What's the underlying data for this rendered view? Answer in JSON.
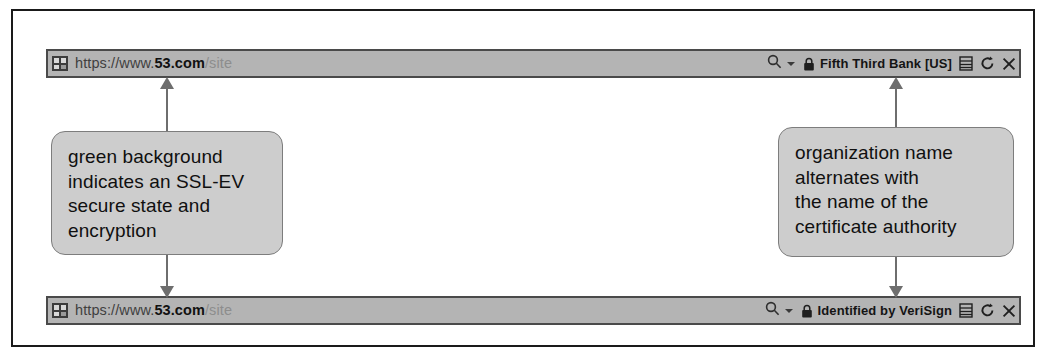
{
  "address_bars": [
    {
      "id": "top",
      "favicon": "site-favicon-icon",
      "url": {
        "full": "https://www.53.com/site",
        "scheme": "https://www.",
        "domain": "53.com",
        "path": "/site"
      },
      "search_icon": "search-icon",
      "dropdown_icon": "chevron-down-icon",
      "lock_icon": "padlock-icon",
      "security_label": "Fifth Third Bank [US]",
      "buttons": [
        {
          "name": "compatibility-view-icon",
          "label": "Compatibility View"
        },
        {
          "name": "refresh-icon",
          "label": "Refresh"
        },
        {
          "name": "stop-icon",
          "label": "Stop"
        }
      ]
    },
    {
      "id": "bottom",
      "favicon": "site-favicon-icon",
      "url": {
        "full": "https://www.53.com/site",
        "scheme": "https://www.",
        "domain": "53.com",
        "path": "/site"
      },
      "search_icon": "search-icon",
      "dropdown_icon": "chevron-down-icon",
      "lock_icon": "padlock-icon",
      "security_label": "Identified by VeriSign",
      "buttons": [
        {
          "name": "compatibility-view-icon",
          "label": "Compatibility View"
        },
        {
          "name": "refresh-icon",
          "label": "Refresh"
        },
        {
          "name": "stop-icon",
          "label": "Stop"
        }
      ]
    }
  ],
  "callouts": {
    "left": {
      "lines": [
        "green background",
        "indicates an SSL-EV",
        "secure state and",
        "encryption"
      ]
    },
    "right": {
      "lines": [
        "organization name",
        "alternates with",
        "the name of the",
        "certificate authority"
      ]
    }
  },
  "colors": {
    "bar_background": "#b4b4b4",
    "bar_border": "#4a4a4a",
    "callout_background": "#cdcdcd",
    "callout_border": "#7d7d7d",
    "arrow": "#6e6e6e",
    "frame": "#1a1a1a",
    "domain_text": "#111111",
    "path_text": "#8d8d8d"
  }
}
